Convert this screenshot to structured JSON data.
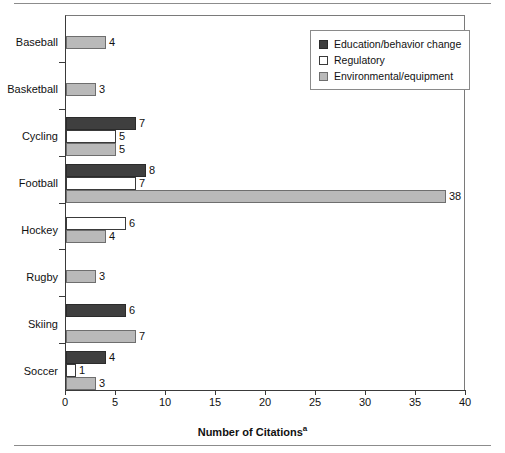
{
  "chart_data": {
    "type": "bar",
    "orientation": "horizontal",
    "title": "",
    "xlabel": "Number of Citations",
    "xlabel_superscript": "a",
    "ylabel": "",
    "xlim": [
      0,
      40
    ],
    "xticks": [
      0,
      5,
      10,
      15,
      20,
      25,
      30,
      35,
      40
    ],
    "grid": false,
    "legend_position": "top-right",
    "categories": [
      "Baseball",
      "Basketball",
      "Cycling",
      "Football",
      "Hockey",
      "Rugby",
      "Skiing",
      "Soccer"
    ],
    "series": [
      {
        "name": "Education/behavior change",
        "color": "#3f3f3f",
        "values": [
          null,
          null,
          7,
          8,
          null,
          null,
          6,
          4
        ]
      },
      {
        "name": "Regulatory",
        "color": "#ffffff",
        "values": [
          null,
          null,
          5,
          7,
          6,
          null,
          0,
          1
        ]
      },
      {
        "name": "Environmental/equipment",
        "color": "#b9b9b9",
        "values": [
          4,
          3,
          5,
          38,
          4,
          3,
          7,
          3
        ]
      }
    ]
  },
  "axis": {
    "x_title": "Number of Citations",
    "x_title_sup": "a",
    "tick_labels": [
      "0",
      "5",
      "10",
      "15",
      "20",
      "25",
      "30",
      "35",
      "40"
    ]
  },
  "legend": {
    "items": [
      {
        "label": "Education/behavior change",
        "swatch": "s0"
      },
      {
        "label": "Regulatory",
        "swatch": "s1"
      },
      {
        "label": "Environmental/equipment",
        "swatch": "s2"
      }
    ]
  },
  "categories": [
    {
      "label": "Baseball"
    },
    {
      "label": "Basketball"
    },
    {
      "label": "Cycling"
    },
    {
      "label": "Football"
    },
    {
      "label": "Hockey"
    },
    {
      "label": "Rugby"
    },
    {
      "label": "Skiing"
    },
    {
      "label": "Soccer"
    }
  ],
  "colors": {
    "series_education": "#3f3f3f",
    "series_regulatory": "#ffffff",
    "series_environmental": "#b9b9b9",
    "axis": "#3a3a3a",
    "rule": "#8c8c8c"
  }
}
